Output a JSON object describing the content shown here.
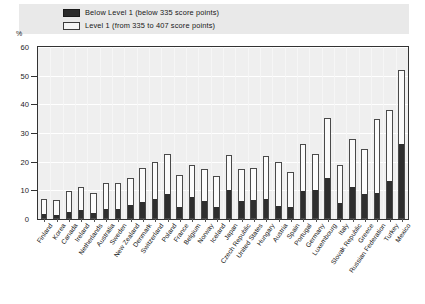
{
  "legend": {
    "items": [
      {
        "label": "Below Level 1  (below 335 score points)",
        "swatch": "dark-square-icon",
        "color": "#2b2b2b"
      },
      {
        "label": "Level 1  (from 335 to 407 score points)",
        "swatch": "light-square-icon",
        "color": "#f4f4f4"
      }
    ]
  },
  "axis": {
    "unit_label": "%",
    "y_ticks": [
      "0",
      "10",
      "20",
      "30",
      "40",
      "50",
      "60"
    ]
  },
  "chart_data": {
    "type": "bar",
    "title": "",
    "subtitle": "",
    "xlabel": "",
    "ylabel": "%",
    "ylim": [
      0,
      60
    ],
    "ytick_step": 10,
    "grid": true,
    "stacked": true,
    "legend_position": "top",
    "categories": [
      "Finland",
      "Korea",
      "Canada",
      "Ireland",
      "Netherlands",
      "Australia",
      "Sweden",
      "New Zealand",
      "Denmark",
      "Switzerland",
      "Poland",
      "France",
      "Belgium",
      "Norway",
      "Iceland",
      "Japan",
      "Czech Republic",
      "United States",
      "Hungary",
      "Austria",
      "Spain",
      "Portugal",
      "Germany",
      "Luxembourg",
      "Italy",
      "Slovak Republic",
      "Greece",
      "Russian Federation",
      "Turkey",
      "Mexico"
    ],
    "series": [
      {
        "name": "Below Level 1  (below 335 score points)",
        "color": "#2e2e2e",
        "values": [
          1.7,
          1.0,
          2.4,
          3.1,
          2.0,
          3.3,
          3.3,
          4.8,
          5.9,
          7.0,
          8.7,
          4.2,
          7.7,
          6.3,
          4.0,
          10.0,
          6.1,
          6.4,
          7.0,
          4.4,
          4.1,
          9.6,
          10.0,
          14.2,
          5.4,
          11.0,
          8.7,
          9.0,
          13.0,
          26.0
        ]
      },
      {
        "name": "Level 1  (from 335 to 407 score points)",
        "color": "#fbfbfb",
        "values": [
          5.2,
          5.8,
          7.2,
          7.9,
          7.0,
          9.1,
          9.3,
          9.6,
          12.0,
          13.0,
          14.0,
          11.0,
          11.3,
          11.2,
          11.0,
          12.2,
          11.5,
          11.5,
          15.0,
          15.4,
          12.2,
          16.7,
          12.7,
          21.0,
          13.5,
          17.0,
          15.6,
          26.0,
          25.0,
          26.0
        ]
      }
    ],
    "totals": [
      6.9,
      6.8,
      9.6,
      11.0,
      9.0,
      12.4,
      12.6,
      14.4,
      17.9,
      20.0,
      22.7,
      15.2,
      19.0,
      17.5,
      15.0,
      22.2,
      17.6,
      17.9,
      22.0,
      19.8,
      16.3,
      26.3,
      22.7,
      35.2,
      18.9,
      28.0,
      24.3,
      35.0,
      38.0,
      52.0
    ]
  }
}
